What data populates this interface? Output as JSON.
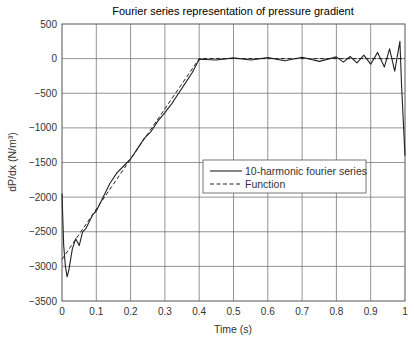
{
  "chart_data": {
    "type": "line",
    "title": "Fourier series representation of pressure gradient",
    "xlabel": "Time (s)",
    "ylabel": "dP/dx (N/m³)",
    "xlim": [
      0,
      1
    ],
    "ylim": [
      -3500,
      500
    ],
    "xticks": [
      "0",
      "0.1",
      "0.2",
      "0.3",
      "0.4",
      "0.5",
      "0.6",
      "0.7",
      "0.8",
      "0.9",
      "1"
    ],
    "yticks": [
      "500",
      "0",
      "−500",
      "−1000",
      "−1500",
      "−2000",
      "−2500",
      "−3000",
      "−3500"
    ],
    "grid": true,
    "legend_position": "center-right",
    "series": [
      {
        "name": "10-harmonic fourier series",
        "style": "solid",
        "x": [
          0,
          0.005,
          0.01,
          0.015,
          0.02,
          0.03,
          0.04,
          0.05,
          0.06,
          0.07,
          0.08,
          0.09,
          0.1,
          0.12,
          0.14,
          0.16,
          0.18,
          0.2,
          0.22,
          0.24,
          0.26,
          0.28,
          0.3,
          0.32,
          0.34,
          0.36,
          0.38,
          0.4,
          0.45,
          0.5,
          0.55,
          0.6,
          0.65,
          0.7,
          0.75,
          0.8,
          0.82,
          0.84,
          0.86,
          0.88,
          0.9,
          0.92,
          0.94,
          0.955,
          0.97,
          0.985,
          0.99,
          1.0
        ],
        "y": [
          -1950,
          -2700,
          -3000,
          -3150,
          -3050,
          -2750,
          -2600,
          -2700,
          -2500,
          -2450,
          -2350,
          -2250,
          -2200,
          -2000,
          -1800,
          -1650,
          -1550,
          -1450,
          -1300,
          -1150,
          -1050,
          -900,
          -780,
          -650,
          -500,
          -350,
          -200,
          -10,
          -20,
          10,
          -20,
          15,
          -30,
          20,
          -40,
          25,
          -50,
          30,
          -60,
          50,
          -80,
          90,
          -120,
          140,
          -180,
          250,
          -400,
          -1400
        ]
      },
      {
        "name": "Function",
        "style": "dashed",
        "x": [
          0,
          0.4,
          1.0
        ],
        "y": [
          -2900,
          0,
          0
        ]
      }
    ]
  }
}
